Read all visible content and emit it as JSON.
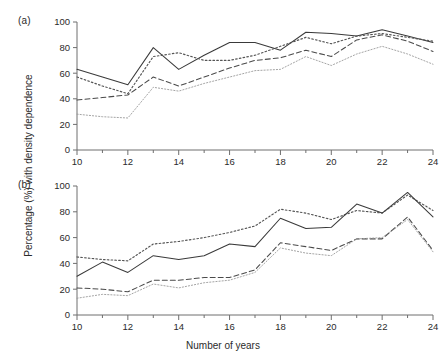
{
  "figure": {
    "panel_a_label": "(a)",
    "panel_b_label": "(b)",
    "ylabel": "Percentage (%) with density dependence",
    "xlabel": "Number of years"
  },
  "chart_data": [
    {
      "type": "line",
      "panel": "(a)",
      "title": "",
      "xlabel": "",
      "ylabel": "Percentage (%) with density dependence",
      "xlim": [
        10,
        24
      ],
      "ylim": [
        0,
        100
      ],
      "xticks": [
        10,
        11,
        12,
        13,
        14,
        15,
        16,
        17,
        18,
        19,
        20,
        21,
        22,
        23,
        24
      ],
      "xticklabels": [
        "10",
        "",
        "12",
        "",
        "14",
        "",
        "16",
        "",
        "18",
        "",
        "20",
        "",
        "22",
        "",
        "24"
      ],
      "yticks": [
        0,
        20,
        40,
        60,
        80,
        100
      ],
      "yticklabels": [
        "0",
        "20",
        "40",
        "60",
        "80",
        "100"
      ],
      "grid": false,
      "legend": "none",
      "x": [
        10,
        11,
        12,
        13,
        14,
        15,
        16,
        17,
        18,
        19,
        20,
        21,
        22,
        23,
        24
      ],
      "series": [
        {
          "name": "solid",
          "style": "solid",
          "color": "#3a3a3a",
          "values": [
            63,
            57,
            51,
            80,
            63,
            74,
            84,
            84,
            78,
            92,
            91,
            89,
            94,
            89,
            84
          ]
        },
        {
          "name": "dotted",
          "style": "dotted",
          "color": "#555555",
          "values": [
            57,
            50,
            44,
            73,
            76,
            70,
            70,
            74,
            81,
            88,
            83,
            89,
            91,
            88,
            85
          ]
        },
        {
          "name": "dashed",
          "style": "dashed",
          "color": "#4a4a4a",
          "values": [
            39,
            41,
            43,
            57,
            50,
            57,
            64,
            70,
            72,
            78,
            73,
            86,
            90,
            85,
            77
          ]
        },
        {
          "name": "fine-dotted",
          "style": "fine-dotted",
          "color": "#9a9a9a",
          "values": [
            28,
            26,
            25,
            49,
            46,
            52,
            57,
            62,
            63,
            73,
            66,
            75,
            81,
            75,
            67
          ]
        }
      ]
    },
    {
      "type": "line",
      "panel": "(b)",
      "title": "",
      "xlabel": "Number of years",
      "ylabel": "Percentage (%) with density dependence",
      "xlim": [
        10,
        24
      ],
      "ylim": [
        0,
        100
      ],
      "xticks": [
        10,
        11,
        12,
        13,
        14,
        15,
        16,
        17,
        18,
        19,
        20,
        21,
        22,
        23,
        24
      ],
      "xticklabels": [
        "10",
        "",
        "12",
        "",
        "14",
        "",
        "16",
        "",
        "18",
        "",
        "20",
        "",
        "22",
        "",
        "24"
      ],
      "yticks": [
        0,
        20,
        40,
        60,
        80,
        100
      ],
      "yticklabels": [
        "0",
        "20",
        "40",
        "60",
        "80",
        "100"
      ],
      "grid": false,
      "legend": "none",
      "x": [
        10,
        11,
        12,
        13,
        14,
        15,
        16,
        17,
        18,
        19,
        20,
        21,
        22,
        23,
        24
      ],
      "series": [
        {
          "name": "dotted",
          "style": "dotted",
          "color": "#555555",
          "values": [
            45,
            43,
            42,
            55,
            57,
            60,
            64,
            69,
            82,
            79,
            74,
            81,
            79,
            93,
            81
          ]
        },
        {
          "name": "solid",
          "style": "solid",
          "color": "#3a3a3a",
          "values": [
            30,
            41,
            33,
            46,
            43,
            46,
            55,
            53,
            75,
            67,
            68,
            86,
            79,
            95,
            76
          ]
        },
        {
          "name": "dashed",
          "style": "dashed",
          "color": "#4a4a4a",
          "values": [
            21,
            20,
            18,
            27,
            27,
            29,
            29,
            35,
            56,
            53,
            50,
            59,
            59,
            76,
            50
          ]
        },
        {
          "name": "fine-dotted",
          "style": "fine-dotted",
          "color": "#9a9a9a",
          "values": [
            13,
            16,
            15,
            24,
            21,
            25,
            27,
            33,
            52,
            48,
            46,
            59,
            60,
            74,
            49
          ]
        }
      ]
    }
  ]
}
